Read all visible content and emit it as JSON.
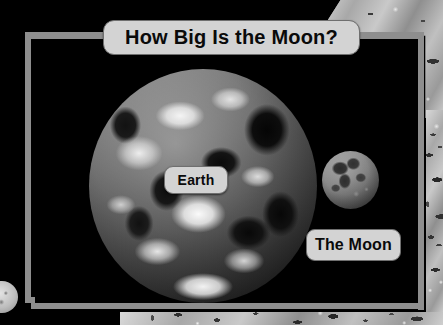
{
  "slide": {
    "title": "How Big Is the Moon?",
    "background_color": "#000000",
    "frame_color": "#8e8e8e",
    "label_box_color": "#d3d3d3",
    "label_text_color": "#0a0a0a"
  },
  "labels": [
    {
      "id": "earth",
      "text": "Earth"
    },
    {
      "id": "moon",
      "text": "The Moon"
    }
  ],
  "objects": [
    {
      "name": "earth-sphere",
      "label": "Earth"
    },
    {
      "name": "moon-sphere",
      "label": "The Moon"
    },
    {
      "name": "edge-sphere",
      "label": ""
    }
  ],
  "decor": {
    "texture_topright": "lunar-surface-texture",
    "texture_right": "lunar-surface-texture",
    "texture_bottom": "lunar-surface-texture"
  }
}
